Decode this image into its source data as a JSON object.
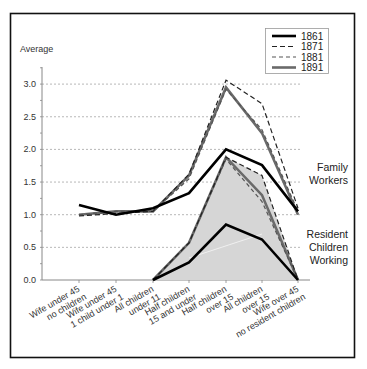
{
  "chart_data": {
    "type": "line",
    "title": "",
    "ylabel": "Average",
    "xlabel": "",
    "ylim": [
      0,
      3.0
    ],
    "yticks": [
      "0.0",
      "0.5",
      "1.0",
      "1.5",
      "2.0",
      "2.5",
      "3.0"
    ],
    "grid": "dotted horizontal",
    "legend_position": "top-right",
    "categories": [
      "Wife under 45 no children",
      "Wife under 45 1 child under 1",
      "All children under 11",
      "Half children 15 and under",
      "Half children over 15",
      "All children over 15",
      "Wife over 45 no resident children"
    ],
    "category_lines": [
      [
        "Wife under 45",
        "no children"
      ],
      [
        "Wife under 45",
        "1 child under 1"
      ],
      [
        "All children",
        "under 11"
      ],
      [
        "Half children",
        "15 and under"
      ],
      [
        "Half children",
        "over 15"
      ],
      [
        "All children",
        "over 15"
      ],
      [
        "Wife over 45",
        "no resident children"
      ]
    ],
    "legend": [
      "1861",
      "1871",
      "1881",
      "1891"
    ],
    "groups": [
      {
        "name": "Family Workers",
        "label_lines": [
          "Family",
          "Workers"
        ],
        "series": [
          {
            "name": "1861",
            "values": [
              1.15,
              1.0,
              1.1,
              1.33,
              2.0,
              1.76,
              1.05
            ]
          },
          {
            "name": "1871",
            "values": [
              0.98,
              1.02,
              1.05,
              1.62,
              3.06,
              2.7,
              1.1
            ]
          },
          {
            "name": "1881",
            "values": [
              1.0,
              1.05,
              1.05,
              1.55,
              2.92,
              2.3,
              1.05
            ]
          },
          {
            "name": "1891",
            "values": [
              1.0,
              1.05,
              1.05,
              1.6,
              2.95,
              2.25,
              1.0
            ]
          }
        ]
      },
      {
        "name": "Resident Children Working",
        "label_lines": [
          "Resident",
          "Children",
          "Working"
        ],
        "start_category_index": 2,
        "series": [
          {
            "name": "1861",
            "values": [
              null,
              null,
              0,
              0.27,
              0.85,
              0.62,
              0
            ]
          },
          {
            "name": "1871",
            "values": [
              null,
              null,
              0,
              0.57,
              1.88,
              1.6,
              0
            ]
          },
          {
            "name": "1881",
            "values": [
              null,
              null,
              0,
              0.57,
              1.85,
              1.2,
              0
            ]
          },
          {
            "name": "1891",
            "values": [
              null,
              null,
              0,
              0.57,
              1.88,
              1.3,
              0
            ]
          }
        ]
      }
    ]
  },
  "styles": {
    "1861": {
      "color": "#000000",
      "width": 2.6,
      "dash": ""
    },
    "1871": {
      "color": "#222222",
      "width": 1.2,
      "dash": "5,3"
    },
    "1881": {
      "color": "#555555",
      "width": 1.2,
      "dash": "4,3"
    },
    "1891": {
      "color": "#6a6a6a",
      "width": 2.6,
      "dash": ""
    },
    "shade": "#d6d6d6"
  }
}
